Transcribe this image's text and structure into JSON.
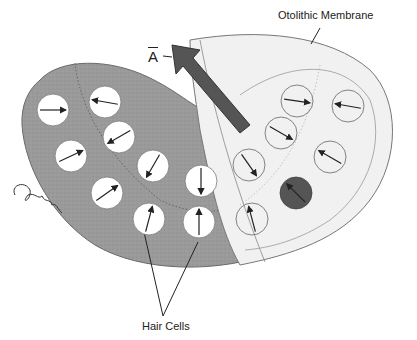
{
  "labels": {
    "otolithic_membrane": "Otolithic Membrane",
    "hair_cells": "Hair Cells",
    "vector": "A"
  },
  "colors": {
    "macula_gray": "#9a9a9a",
    "membrane_light": "#f1f1f1",
    "arrow_dark": "#555555",
    "cell_white": "#ffffff",
    "highlight_cell": "#555555",
    "ink": "#222222"
  },
  "hair_cells_left": [
    {
      "cx": 53,
      "cy": 110,
      "angle": 0
    },
    {
      "cx": 105,
      "cy": 102,
      "angle": 190
    },
    {
      "cx": 119,
      "cy": 137,
      "angle": 150
    },
    {
      "cx": 71,
      "cy": 156,
      "angle": -25
    },
    {
      "cx": 153,
      "cy": 166,
      "angle": 120
    },
    {
      "cx": 107,
      "cy": 193,
      "angle": -35
    },
    {
      "cx": 201,
      "cy": 181,
      "angle": 90
    },
    {
      "cx": 149,
      "cy": 219,
      "angle": -75
    },
    {
      "cx": 199,
      "cy": 222,
      "angle": -90
    }
  ],
  "hair_cells_right": [
    {
      "cx": 297,
      "cy": 101,
      "angle": 8
    },
    {
      "cx": 348,
      "cy": 106,
      "angle": 190
    },
    {
      "cx": 281,
      "cy": 133,
      "angle": 30
    },
    {
      "cx": 330,
      "cy": 157,
      "angle": 210
    },
    {
      "cx": 249,
      "cy": 165,
      "angle": 55
    },
    {
      "cx": 252,
      "cy": 219,
      "angle": -105
    }
  ],
  "highlight_cell": {
    "cx": 296,
    "cy": 193,
    "angle": 225
  }
}
